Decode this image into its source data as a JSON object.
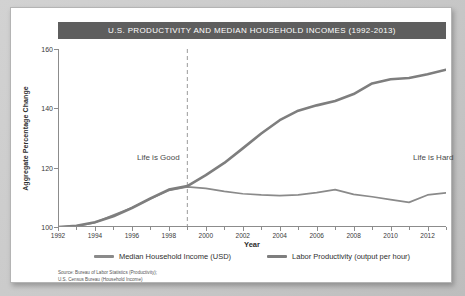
{
  "chart_data": {
    "type": "line",
    "title": "U.S. PRODUCTIVITY AND MEDIAN HOUSEHOLD INCOMES (1992-2013)",
    "xlabel": "Year",
    "ylabel": "Aggregate Percentage Change",
    "xlim": [
      1992,
      2013
    ],
    "ylim": [
      100,
      160
    ],
    "y_ticks": [
      100,
      120,
      140,
      160
    ],
    "x_ticks": [
      1992,
      1994,
      1996,
      1998,
      2000,
      2002,
      2004,
      2006,
      2008,
      2010,
      2012
    ],
    "x_minor_ticks": [
      1993,
      1995,
      1997,
      1999,
      2001,
      2003,
      2005,
      2007,
      2009,
      2011,
      2013
    ],
    "grid": false,
    "legend_position": "below",
    "x": [
      1992,
      1993,
      1994,
      1995,
      1996,
      1997,
      1998,
      1999,
      2000,
      2001,
      2002,
      2003,
      2004,
      2005,
      2006,
      2007,
      2008,
      2009,
      2010,
      2011,
      2012,
      2013
    ],
    "series": [
      {
        "name": "Median Household Income (USD)",
        "color": "#8a8a8a",
        "values": [
          100.0,
          100.3,
          101.5,
          104.0,
          106.5,
          109.5,
          112.3,
          113.5,
          113.0,
          112.0,
          111.2,
          110.8,
          110.6,
          110.8,
          111.6,
          112.6,
          111.0,
          110.2,
          109.2,
          108.3,
          110.8,
          111.5
        ]
      },
      {
        "name": "Labor Productivity (output per hour)",
        "color": "#7e7e7e",
        "values": [
          100.0,
          100.4,
          101.6,
          103.6,
          106.4,
          109.6,
          112.6,
          113.8,
          117.5,
          121.6,
          126.5,
          131.5,
          136.0,
          139.2,
          141.0,
          142.5,
          144.8,
          148.4,
          149.8,
          150.2,
          151.5,
          153.0
        ]
      }
    ],
    "annotations": [
      {
        "text": "Life is Good",
        "x": 1994.5,
        "y": 134
      },
      {
        "text": "Life is Hard",
        "x": 2009.5,
        "y": 134
      }
    ],
    "reference_line": {
      "x": 1999,
      "style": "dashed",
      "color": "#9a9a9a"
    },
    "source_lines": [
      "Source: Bureau of Labor Statistics (Productivity);",
      "U.S. Census Bureau (Household Income)"
    ]
  }
}
